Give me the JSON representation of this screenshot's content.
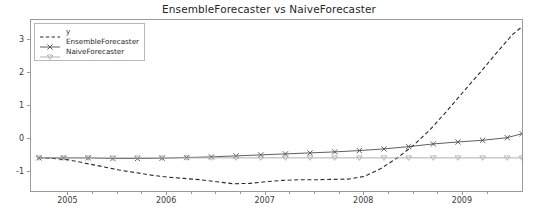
{
  "chart_data": {
    "type": "line",
    "title": "EnsembleForecaster vs NaiveForecaster",
    "xlabel": "",
    "ylabel": "",
    "xlim": [
      2004.62,
      2009.62
    ],
    "ylim": [
      -1.62,
      3.6
    ],
    "grid": false,
    "legend_position": "upper left",
    "xticks": [
      2005,
      2006,
      2007,
      2008,
      2009
    ],
    "xtick_labels": [
      "2005",
      "2006",
      "2007",
      "2008",
      "2009"
    ],
    "yticks": [
      -1,
      0,
      1,
      2,
      3
    ],
    "ytick_labels": [
      "-1",
      "0",
      "1",
      "2",
      "3"
    ],
    "x_minor_ticks": [
      2005.25,
      2005.5,
      2005.75,
      2006.25,
      2006.5,
      2006.75,
      2007.25,
      2007.5,
      2007.75,
      2008.25,
      2008.5,
      2008.75,
      2009.25,
      2009.5
    ],
    "series": [
      {
        "name": "y",
        "style": "dashed",
        "color": "#2b2b2b",
        "marker": "none",
        "x": [
          2004.7,
          2004.85,
          2005.0,
          2005.17,
          2005.34,
          2005.5,
          2005.67,
          2005.84,
          2006.0,
          2006.17,
          2006.34,
          2006.5,
          2006.67,
          2006.84,
          2007.0,
          2007.17,
          2007.34,
          2007.5,
          2007.67,
          2007.84,
          2008.0,
          2008.17,
          2008.34,
          2008.5,
          2008.67,
          2008.84,
          2009.0,
          2009.17,
          2009.34,
          2009.5,
          2009.6
        ],
        "y": [
          -0.55,
          -0.58,
          -0.62,
          -0.72,
          -0.82,
          -0.92,
          -1.0,
          -1.08,
          -1.14,
          -1.18,
          -1.22,
          -1.28,
          -1.34,
          -1.33,
          -1.28,
          -1.24,
          -1.22,
          -1.22,
          -1.21,
          -1.2,
          -1.12,
          -0.88,
          -0.55,
          -0.18,
          0.3,
          0.86,
          1.42,
          2.0,
          2.6,
          3.15,
          3.4
        ]
      },
      {
        "name": "EnsembleForecaster",
        "style": "solid",
        "color": "#4d4d4d",
        "marker": "x",
        "x": [
          2004.7,
          2004.95,
          2005.2,
          2005.45,
          2005.7,
          2005.95,
          2006.2,
          2006.45,
          2006.7,
          2006.95,
          2007.2,
          2007.45,
          2007.7,
          2007.95,
          2008.2,
          2008.45,
          2008.7,
          2008.95,
          2009.2,
          2009.45,
          2009.6
        ],
        "y": [
          -0.56,
          -0.56,
          -0.56,
          -0.58,
          -0.58,
          -0.57,
          -0.55,
          -0.53,
          -0.5,
          -0.47,
          -0.44,
          -0.41,
          -0.38,
          -0.34,
          -0.29,
          -0.22,
          -0.14,
          -0.08,
          -0.03,
          0.05,
          0.17
        ]
      },
      {
        "name": "NaiveForecaster",
        "style": "solid",
        "color": "#a8a8a8",
        "marker": "tri_down",
        "x": [
          2004.7,
          2004.95,
          2005.2,
          2005.45,
          2005.7,
          2005.95,
          2006.2,
          2006.45,
          2006.7,
          2006.95,
          2007.2,
          2007.45,
          2007.7,
          2007.95,
          2008.2,
          2008.45,
          2008.7,
          2008.95,
          2009.2,
          2009.45,
          2009.6
        ],
        "y": [
          -0.56,
          -0.56,
          -0.56,
          -0.56,
          -0.56,
          -0.56,
          -0.56,
          -0.56,
          -0.56,
          -0.56,
          -0.56,
          -0.56,
          -0.56,
          -0.56,
          -0.56,
          -0.56,
          -0.56,
          -0.56,
          -0.56,
          -0.56,
          -0.56
        ]
      }
    ],
    "legend_entries": [
      {
        "label": "y",
        "color": "#2b2b2b",
        "style": "dashed",
        "marker": "none"
      },
      {
        "label": "EnsembleForecaster",
        "color": "#4d4d4d",
        "style": "solid",
        "marker": "x"
      },
      {
        "label": "NaiveForecaster",
        "color": "#a8a8a8",
        "style": "solid",
        "marker": "tri_down"
      }
    ],
    "colors": {
      "axis": "#9a9a9a",
      "text": "#262626",
      "background": "#ffffff"
    }
  }
}
